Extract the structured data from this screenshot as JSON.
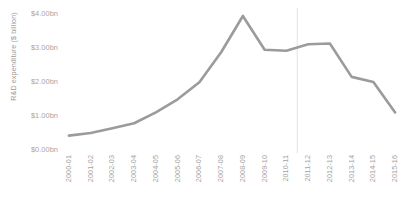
{
  "chart_data": {
    "type": "line",
    "title": "",
    "xlabel": "",
    "ylabel": "R&D expenditure ($ billion)",
    "categories": [
      "2000-01",
      "2001-02",
      "2002-03",
      "2003-04",
      "2004-05",
      "2005-06",
      "2006-07",
      "2007-08",
      "2008-09",
      "2009-10",
      "2010-11",
      "2011-12",
      "2012-13",
      "2013-14",
      "2014-15",
      "2015-16"
    ],
    "values": [
      0.48,
      0.55,
      0.68,
      0.82,
      1.12,
      1.48,
      1.95,
      2.78,
      3.78,
      2.85,
      2.82,
      3.0,
      3.02,
      2.1,
      1.96,
      1.12
    ],
    "ylim": [
      0,
      4
    ],
    "yticks": [
      0,
      1,
      2,
      3,
      4
    ],
    "ytick_labels": [
      "$0.00bn",
      "$1.00bn",
      "$2.00bn",
      "$3.00bn",
      "$4.00bn"
    ],
    "grid": false,
    "legend": "none",
    "series_color": "#9b9b9b",
    "axis_color": "#d9d9d9",
    "tick_label_color": "#a3a3a3",
    "annotations": [
      {
        "name": "forecast-divider",
        "type": "vline",
        "at_category": "2010-11",
        "offset": 0.5,
        "color": "#e2e2e2"
      }
    ]
  }
}
